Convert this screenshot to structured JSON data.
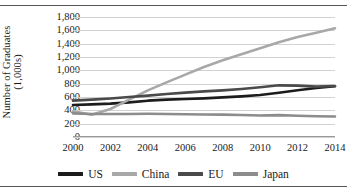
{
  "chart_data": {
    "type": "line",
    "title": "",
    "xlabel": "",
    "ylabel": "Number of Graduates",
    "ylabel_line2": "(1,000s)",
    "x": [
      2000,
      2001,
      2002,
      2003,
      2004,
      2005,
      2006,
      2007,
      2008,
      2009,
      2010,
      2011,
      2012,
      2013,
      2014
    ],
    "xtick_labels": [
      "2000",
      "2002",
      "2004",
      "2006",
      "2008",
      "2010",
      "2012",
      "2014"
    ],
    "xtick_values": [
      2000,
      2002,
      2004,
      2006,
      2008,
      2010,
      2012,
      2014
    ],
    "ytick_labels": [
      "0",
      "200",
      "400",
      "600",
      "800",
      "1,000",
      "1,200",
      "1,400",
      "1,600",
      "1,800"
    ],
    "ytick_values": [
      0,
      200,
      400,
      600,
      800,
      1000,
      1200,
      1400,
      1600,
      1800
    ],
    "ylim": [
      0,
      1800
    ],
    "xlim": [
      2000,
      2014
    ],
    "grid": true,
    "grid_axis": "y",
    "legend_position": "bottom",
    "series": [
      {
        "name": "US",
        "color": "#1c1c1c",
        "values": [
          480,
          490,
          500,
          520,
          545,
          560,
          570,
          580,
          595,
          610,
          630,
          665,
          700,
          735,
          760
        ]
      },
      {
        "name": "China",
        "color": "#a8a8a8",
        "values": [
          385,
          335,
          420,
          560,
          700,
          820,
          935,
          1050,
          1150,
          1240,
          1330,
          1420,
          1500,
          1565,
          1630
        ]
      },
      {
        "name": "EU",
        "color": "#4a4a4a",
        "values": [
          545,
          560,
          578,
          600,
          620,
          645,
          665,
          685,
          700,
          720,
          745,
          775,
          770,
          755,
          765
        ]
      },
      {
        "name": "Japan",
        "color": "#8c8c8c",
        "values": [
          355,
          345,
          345,
          345,
          348,
          345,
          342,
          338,
          335,
          330,
          322,
          328,
          318,
          312,
          308
        ]
      }
    ]
  },
  "legend": {
    "items": [
      {
        "label": "US",
        "color": "#1c1c1c"
      },
      {
        "label": "China",
        "color": "#a8a8a8"
      },
      {
        "label": "EU",
        "color": "#4a4a4a"
      },
      {
        "label": "Japan",
        "color": "#8c8c8c"
      }
    ]
  }
}
